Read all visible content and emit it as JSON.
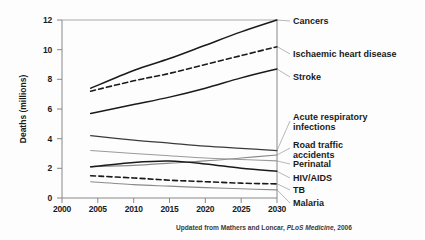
{
  "chart_data": {
    "type": "line",
    "title": "",
    "xlabel": "",
    "ylabel": "Deaths (millions)",
    "xlim": [
      2000,
      2030
    ],
    "ylim": [
      0,
      12
    ],
    "xticks": [
      "2000",
      "2005",
      "2010",
      "2015",
      "2020",
      "2025",
      "2030"
    ],
    "yticks": [
      "0",
      "2",
      "4",
      "6",
      "8",
      "10",
      "12"
    ],
    "grid": false,
    "legend_position": "right-of-plot-inline-labels",
    "x": [
      2004,
      2010,
      2015,
      2020,
      2025,
      2030
    ],
    "series": [
      {
        "name": "Cancers",
        "label": "Cancers",
        "style": "solid",
        "color": "#1a1a1a",
        "width": 1.5,
        "values": [
          7.4,
          8.6,
          9.4,
          10.3,
          11.2,
          12.0
        ]
      },
      {
        "name": "Ischaemic heart disease",
        "label": "Ischaemic heart disease",
        "style": "dashed",
        "color": "#1a1a1a",
        "width": 1.6,
        "values": [
          7.2,
          7.9,
          8.4,
          9.0,
          9.6,
          10.2
        ]
      },
      {
        "name": "Stroke",
        "label": "Stroke",
        "style": "solid",
        "color": "#1a1a1a",
        "width": 1.5,
        "values": [
          5.7,
          6.3,
          6.8,
          7.4,
          8.1,
          8.7
        ]
      },
      {
        "name": "Acute respiratory infections",
        "label": "Acute respiratory\ninfections",
        "style": "solid",
        "color": "#3a3a3a",
        "width": 1.2,
        "values": [
          4.2,
          3.9,
          3.7,
          3.5,
          3.35,
          3.2
        ]
      },
      {
        "name": "Road traffic accidents",
        "label": "Road traffic\naccidents",
        "style": "solid",
        "color": "#8a8a8a",
        "width": 1.1,
        "values": [
          2.1,
          2.2,
          2.35,
          2.5,
          2.7,
          2.9
        ]
      },
      {
        "name": "Perinatal",
        "label": "Perinatal",
        "style": "solid",
        "color": "#9a9a9a",
        "width": 1.1,
        "values": [
          3.2,
          3.0,
          2.85,
          2.7,
          2.6,
          2.5
        ]
      },
      {
        "name": "HIV/AIDS",
        "label": "HIV/AIDS",
        "style": "solid",
        "color": "#1a1a1a",
        "width": 1.5,
        "values": [
          2.1,
          2.4,
          2.5,
          2.3,
          2.0,
          1.8
        ]
      },
      {
        "name": "TB",
        "label": "TB",
        "style": "dashed",
        "color": "#1a1a1a",
        "width": 1.6,
        "values": [
          1.5,
          1.35,
          1.2,
          1.1,
          1.0,
          0.95
        ]
      },
      {
        "name": "Malaria",
        "label": "Malaria",
        "style": "solid",
        "color": "#8a8a8a",
        "width": 1.1,
        "values": [
          1.1,
          0.9,
          0.8,
          0.7,
          0.62,
          0.55
        ]
      }
    ],
    "annotations": {
      "footnote_prefix": "Updated from Mathers and Loncar, ",
      "footnote_italic": "PLoS Medicine",
      "footnote_suffix": ", 2006"
    }
  },
  "labels": {
    "cancers": "Cancers",
    "ihd": "Ischaemic heart disease",
    "stroke": "Stroke",
    "ari_line1": "Acute respiratory",
    "ari_line2": "infections",
    "rta_line1": "Road traffic",
    "rta_line2": "accidents",
    "perinatal": "Perinatal",
    "hiv": "HIV/AIDS",
    "tb": "TB",
    "malaria": "Malaria"
  },
  "axis": {
    "y_title": "Deaths (millions)",
    "y_0": "0",
    "y_2": "2",
    "y_4": "4",
    "y_6": "6",
    "y_8": "8",
    "y_10": "10",
    "y_12": "12",
    "x_2000": "2000",
    "x_2005": "2005",
    "x_2010": "2010",
    "x_2015": "2015",
    "x_2020": "2020",
    "x_2025": "2025",
    "x_2030": "2030"
  },
  "footnote": {
    "prefix": "Updated from Mathers and Loncar, ",
    "journal": "PLoS Medicine",
    "suffix": ", 2006"
  }
}
